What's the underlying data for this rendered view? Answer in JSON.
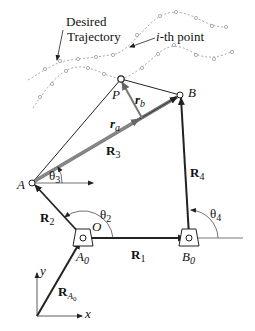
{
  "diagram": {
    "annotations": {
      "desired_trajectory_line1": "Desired",
      "desired_trajectory_line2": "Trajectory",
      "ith_point_prefix": "i",
      "ith_point_suffix": "-th point"
    },
    "points": {
      "P": "P",
      "B": "B",
      "A": "A",
      "O": "O",
      "A0_main": "A",
      "A0_sub": "0",
      "B0_main": "B",
      "B0_sub": "0"
    },
    "vectors": {
      "ra_main": "r",
      "ra_sub": "a",
      "rb_main": "r",
      "rb_sub": "b",
      "R1_main": "R",
      "R1_sub": "1",
      "R2_main": "R",
      "R2_sub": "2",
      "R3_main": "R",
      "R3_sub": "3",
      "R4_main": "R",
      "R4_sub": "4",
      "RA0_main": "R",
      "RA0_sub": "A",
      "RA0_subsub": "0"
    },
    "angles": {
      "theta2_main": "θ",
      "theta2_sub": "2",
      "theta3_main": "θ",
      "theta3_sub": "3",
      "theta4_main": "θ",
      "theta4_sub": "4"
    },
    "axes": {
      "x": "x",
      "y": "y"
    }
  }
}
